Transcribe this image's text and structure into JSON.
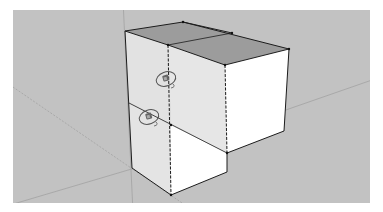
{
  "app": {
    "title": "3D Modeling Viewport"
  },
  "viewport": {
    "background_color": "#c2c2c2",
    "description": "Isometric view of two stacked box components with move/rotate cursors"
  },
  "model": {
    "objects": [
      {
        "name": "Upper box",
        "top_face_color": "#9a9a9a",
        "front_face_color": "#ffffff",
        "side_face_color": "#e6e6e6"
      },
      {
        "name": "Lower box",
        "front_face_color": "#ffffff",
        "side_face_color": "#e6e6e6"
      }
    ],
    "edge_color": "#1a1a1a",
    "axis_color": "#9e9e9e"
  },
  "cursors": [
    {
      "icon": "rotate-tool-icon",
      "position": "upper"
    },
    {
      "icon": "rotate-tool-icon",
      "position": "lower"
    }
  ]
}
